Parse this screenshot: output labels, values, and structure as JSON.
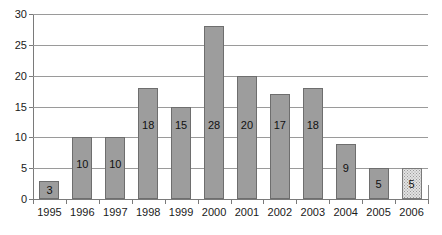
{
  "chart_data": {
    "type": "bar",
    "title": "",
    "xlabel": "",
    "ylabel": "",
    "categories": [
      "1995",
      "1996",
      "1997",
      "1998",
      "1999",
      "2000",
      "2001",
      "2002",
      "2003",
      "2004",
      "2005",
      "2006"
    ],
    "values": [
      3,
      10,
      10,
      18,
      15,
      28,
      20,
      17,
      18,
      9,
      5,
      5
    ],
    "data_labels": [
      "3",
      "10",
      "10",
      "18",
      "15",
      "28",
      "20",
      "17",
      "18",
      "9",
      "5",
      "5"
    ],
    "ylim": [
      0,
      30
    ],
    "ytick_values": [
      0,
      5,
      10,
      15,
      20,
      25,
      30
    ],
    "ytick_labels": [
      "0",
      "5",
      "10",
      "15",
      "20",
      "25",
      "30"
    ],
    "grid": true,
    "legend": false,
    "legend_position": "none",
    "bar_styles": [
      "solid",
      "solid",
      "solid",
      "solid",
      "solid",
      "solid",
      "solid",
      "solid",
      "solid",
      "solid",
      "solid",
      "pattern"
    ],
    "colors": {
      "bar_fill": "#9d9d9d",
      "bar_border": "#6e6e6e",
      "pattern_fill": "#e2e2e2",
      "pattern_dot": "#9a9a9a",
      "gridline": "#9a9a9a",
      "axis": "#7a7a7a",
      "text": "#1a1a1a",
      "background": "#ffffff"
    }
  }
}
